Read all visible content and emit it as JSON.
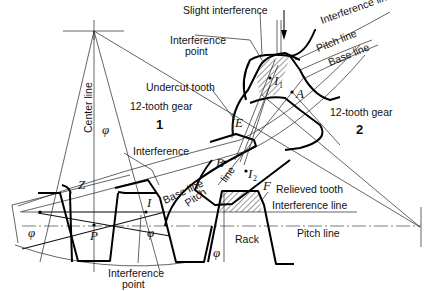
{
  "diagram": {
    "labels": {
      "slight_interference": "Slight interference",
      "interference_line_top": "Interference line",
      "pitch_line_top": "Pitch line",
      "base_line_top": "Base line",
      "interference_point_top": "Interference",
      "interference_point_top2": "point",
      "undercut_tooth": "Undercut tooth",
      "gear1": "12-tooth gear",
      "gear1_num": "1",
      "gear2": "12-tooth gear",
      "gear2_num": "2",
      "center_line": "Center line",
      "interference_left": "Interference",
      "base_line_mid": "Base line",
      "pitch_line_mid": "Pitch line",
      "relieved_tooth": "Relieved tooth",
      "interference_line_rack": "Interference line",
      "pitch_line_rack": "Pitch line",
      "rack": "Rack",
      "interference_point_bottom": "Interference",
      "interference_point_bottom2": "point"
    },
    "symbols": {
      "phi": "φ",
      "Z": "Z",
      "P": "P",
      "I": "I",
      "I1": "I",
      "I1_sub": "1",
      "I2": "I",
      "I2_sub": "2",
      "A": "A",
      "B": "B",
      "E": "E",
      "F": "F"
    }
  }
}
